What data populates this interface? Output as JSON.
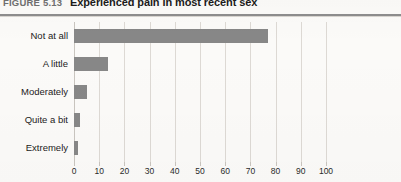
{
  "figure": {
    "number_label": "FIGURE 5.13",
    "title": "Experienced pain in most recent sex"
  },
  "colors": {
    "bar": "#878787",
    "gridline": "#ddd9d4",
    "axis": "#c9c5bf",
    "background": "#fbfaf8",
    "title_text": "#1b1b1b",
    "figure_number_text": "#6f6f6f",
    "rule": "#8d8d8d"
  },
  "chart_data": {
    "type": "bar",
    "orientation": "horizontal",
    "title": "Experienced pain in most recent sex",
    "xlabel": "",
    "ylabel": "",
    "categories": [
      "Not at all",
      "A little",
      "Moderately",
      "Quite a bit",
      "Extremely"
    ],
    "values": [
      77,
      13.5,
      5.2,
      2.5,
      1.6
    ],
    "xlim": [
      0,
      100
    ],
    "xticks": [
      0,
      10,
      20,
      30,
      40,
      50,
      60,
      70,
      80,
      90,
      100
    ],
    "xtick_labels": [
      "0",
      "10",
      "20",
      "30",
      "40",
      "50",
      "60",
      "70",
      "80",
      "90",
      "100"
    ],
    "grid": "vertical",
    "legend": "none",
    "series": [
      {
        "name": "Percent",
        "values": [
          77,
          13.5,
          5.2,
          2.5,
          1.6
        ]
      }
    ]
  }
}
